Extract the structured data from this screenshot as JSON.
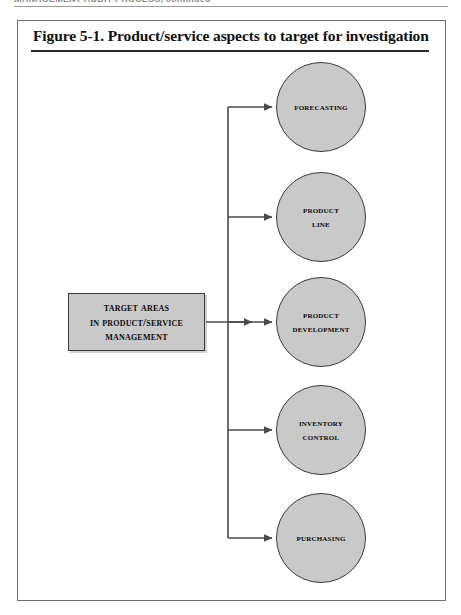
{
  "page": {
    "running_header": "MANAGEMENT AUDIT PROCESS, continued",
    "background_color": "#ffffff"
  },
  "figure": {
    "title": "Figure 5-1.  Product/service aspects to target for investigation",
    "frame_border_color": "#6f6f6f",
    "fill_color": "#c9c9c9",
    "stroke_color": "#3a3a3a"
  },
  "diagram": {
    "type": "hub-and-spoke",
    "source": {
      "shape": "rectangle",
      "label": "TARGET AREAS IN PRODUCT/SERVICE MANAGEMENT",
      "line1": "Target Areas",
      "line2": "in Product/Service",
      "line3": "Management"
    },
    "targets": [
      {
        "shape": "circle",
        "label": "FORECASTING",
        "line1": "Forecasting",
        "line2": ""
      },
      {
        "shape": "circle",
        "label": "PRODUCT LINE",
        "line1": "Product",
        "line2": "Line"
      },
      {
        "shape": "circle",
        "label": "PRODUCT DEVELOPMENT",
        "line1": "Product",
        "line2": "Development"
      },
      {
        "shape": "circle",
        "label": "INVENTORY CONTROL",
        "line1": "Inventory",
        "line2": "Control"
      },
      {
        "shape": "circle",
        "label": "PURCHASING",
        "line1": "Purchasing",
        "line2": ""
      }
    ],
    "connector_style": "orthogonal-arrows",
    "connector_color": "#4a4a4a"
  }
}
